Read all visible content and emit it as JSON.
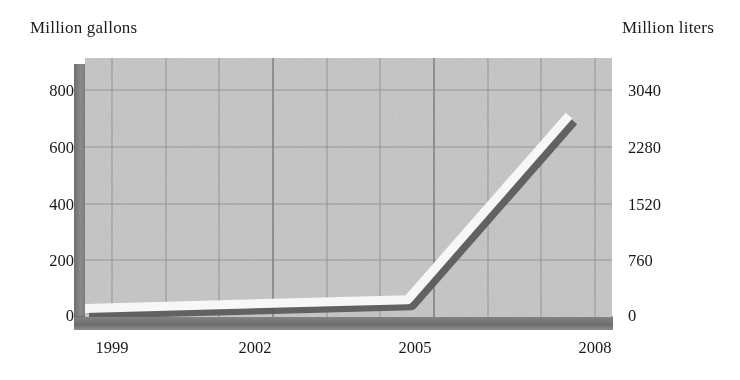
{
  "chart_data": {
    "type": "line",
    "title": "",
    "ylabel": "Million gallons",
    "ylabel_right": "Million liters",
    "xlabel": "",
    "x": [
      1999,
      2005,
      2008
    ],
    "values": [
      30,
      60,
      700
    ],
    "series": [
      {
        "name": "Volume",
        "values": [
          30,
          60,
          700
        ]
      }
    ],
    "xlim": [
      1999,
      2008.8
    ],
    "ylim": [
      0,
      900
    ],
    "ylim_right": [
      0,
      3420
    ],
    "grid": true,
    "legend": "none",
    "style": "3d-ribbon-line",
    "line_color": "#f7f7f7",
    "line_shadow_color": "#595959",
    "plot_bg": "#c9c9c9",
    "xtick_labels": [
      "1999",
      "2002",
      "2005",
      "2008"
    ],
    "xtick_values": [
      1999,
      2002,
      2005,
      2008
    ],
    "ytick_labels_left": [
      "800",
      "600",
      "400",
      "200",
      "0"
    ],
    "ytick_values_left": [
      800,
      600,
      400,
      200,
      0
    ],
    "ytick_labels_right": [
      "3040",
      "2280",
      "1520",
      "760",
      "0"
    ],
    "ytick_values_right": [
      3040,
      2280,
      1520,
      760,
      0
    ],
    "gridline_x_years": [
      1999,
      2000,
      2001,
      2002,
      2003,
      2004,
      2005,
      2006,
      2007,
      2008
    ]
  },
  "labels": {
    "left_axis_title": "Million gallons",
    "right_axis_title": "Million liters",
    "y_left": [
      "800",
      "600",
      "400",
      "200",
      "0"
    ],
    "y_right": [
      "3040",
      "2280",
      "1520",
      "760",
      "0"
    ],
    "x": [
      "1999",
      "2002",
      "2005",
      "2008"
    ]
  }
}
